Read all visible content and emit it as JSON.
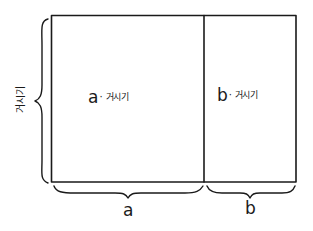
{
  "diagram": {
    "title": "",
    "height_label": "거시기",
    "regions": [
      {
        "id": "left",
        "var": "a",
        "separator": "·",
        "factor": "거시기",
        "width_label": "a"
      },
      {
        "id": "right",
        "var": "b",
        "separator": "·",
        "factor": "거시기",
        "width_label": "b"
      }
    ],
    "colors": {
      "line": "#1a1a1a",
      "background": "#ffffff"
    }
  }
}
